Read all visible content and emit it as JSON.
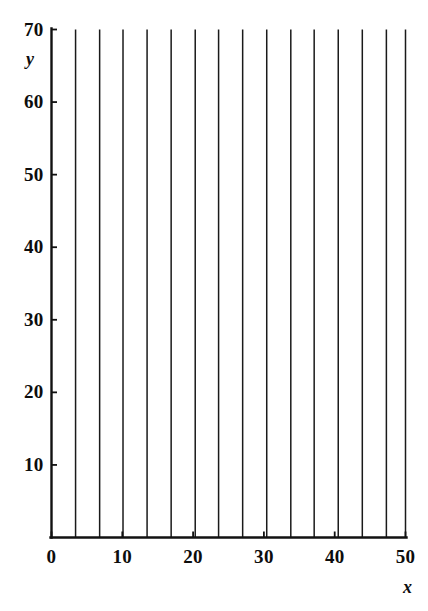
{
  "chart_data": {
    "type": "line",
    "title": "",
    "subtitle": "",
    "xlabel": "x",
    "ylabel": "y",
    "xlim": [
      0,
      50
    ],
    "ylim": [
      0,
      70
    ],
    "xticks": [
      0,
      10,
      20,
      30,
      40,
      50
    ],
    "yticks": [
      10,
      20,
      30,
      40,
      50,
      60,
      70
    ],
    "xtick_labels": [
      "0",
      "10",
      "20",
      "30",
      "40",
      "50"
    ],
    "ytick_labels": [
      "10",
      "20",
      "30",
      "40",
      "50",
      "60",
      "70"
    ],
    "grid": false,
    "legend": null,
    "annotations": [],
    "series": [
      {
        "name": "vertical trajectory 1",
        "x": [
          3.4,
          3.4
        ],
        "values": [
          0,
          70
        ]
      },
      {
        "name": "vertical trajectory 2",
        "x": [
          6.8,
          6.8
        ],
        "values": [
          0,
          70
        ]
      },
      {
        "name": "vertical trajectory 3",
        "x": [
          10.1,
          10.1
        ],
        "values": [
          0,
          70
        ]
      },
      {
        "name": "vertical trajectory 4",
        "x": [
          13.5,
          13.5
        ],
        "values": [
          0,
          70
        ]
      },
      {
        "name": "vertical trajectory 5",
        "x": [
          16.9,
          16.9
        ],
        "values": [
          0,
          70
        ]
      },
      {
        "name": "vertical trajectory 6",
        "x": [
          20.3,
          20.3
        ],
        "values": [
          0,
          70
        ]
      },
      {
        "name": "vertical trajectory 7",
        "x": [
          23.6,
          23.6
        ],
        "values": [
          0,
          70
        ]
      },
      {
        "name": "vertical trajectory 8",
        "x": [
          27.0,
          27.0
        ],
        "values": [
          0,
          70
        ]
      },
      {
        "name": "vertical trajectory 9",
        "x": [
          30.4,
          30.4
        ],
        "values": [
          0,
          70
        ]
      },
      {
        "name": "vertical trajectory 10",
        "x": [
          33.8,
          33.8
        ],
        "values": [
          0,
          70
        ]
      },
      {
        "name": "vertical trajectory 11",
        "x": [
          37.1,
          37.1
        ],
        "values": [
          0,
          70
        ]
      },
      {
        "name": "vertical trajectory 12",
        "x": [
          40.5,
          40.5
        ],
        "values": [
          0,
          70
        ]
      },
      {
        "name": "vertical trajectory 13",
        "x": [
          43.9,
          43.9
        ],
        "values": [
          0,
          70
        ]
      },
      {
        "name": "vertical trajectory 14",
        "x": [
          47.3,
          47.3
        ],
        "values": [
          0,
          70
        ]
      },
      {
        "name": "vertical trajectory 15",
        "x": [
          50.0,
          50.0
        ],
        "values": [
          0,
          70
        ]
      }
    ],
    "colors": {
      "line": "#1a1a1a",
      "axis": "#111111",
      "background": "#ffffff",
      "text": "#0d0d0d"
    }
  }
}
